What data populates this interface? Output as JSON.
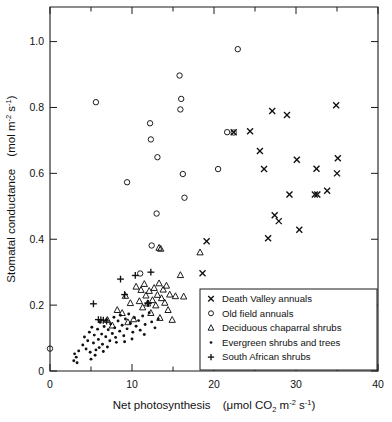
{
  "chart_data": {
    "type": "scatter",
    "title": "",
    "xlabel": "Net photosynthesis  (µmol CO2 m-2 s-1)",
    "ylabel": "Stomatal conductance  (mol m-2 s-1)",
    "xlim": [
      0,
      40
    ],
    "ylim": [
      0,
      1.105
    ],
    "grid": false,
    "legend_position": "bottom-right",
    "x_ticks_major": [
      0,
      10,
      20,
      30,
      40
    ],
    "x_ticks_minor": [
      5,
      15,
      25,
      35
    ],
    "x_tick_labels": [
      "0",
      "10",
      "20",
      "30",
      "40"
    ],
    "y_ticks_major": [
      0,
      0.2,
      0.4,
      0.6,
      0.8,
      1.0
    ],
    "y_tick_labels": [
      "0",
      "0.2",
      "0.4",
      "0.6",
      "0.8",
      "1.0"
    ],
    "series": [
      {
        "name": "Death Valley annuals",
        "marker": "x",
        "points": [
          [
            18.6,
            0.297
          ],
          [
            19.1,
            0.394
          ],
          [
            22.4,
            0.725
          ],
          [
            24.4,
            0.728
          ],
          [
            25.6,
            0.668
          ],
          [
            26.1,
            0.613
          ],
          [
            26.6,
            0.403
          ],
          [
            27.1,
            0.789
          ],
          [
            27.4,
            0.473
          ],
          [
            27.9,
            0.455
          ],
          [
            28.9,
            0.777
          ],
          [
            29.2,
            0.536
          ],
          [
            30.1,
            0.641
          ],
          [
            30.4,
            0.429
          ],
          [
            32.3,
            0.536
          ],
          [
            32.6,
            0.536
          ],
          [
            32.5,
            0.614
          ],
          [
            33.8,
            0.547
          ],
          [
            34.9,
            0.807
          ],
          [
            35.1,
            0.646
          ],
          [
            35.0,
            0.6
          ]
        ]
      },
      {
        "name": "Old field annuals",
        "marker": "o",
        "points": [
          [
            0.0,
            0.068
          ],
          [
            5.6,
            0.816
          ],
          [
            9.4,
            0.573
          ],
          [
            11.0,
            0.296
          ],
          [
            12.2,
            0.752
          ],
          [
            12.3,
            0.703
          ],
          [
            12.4,
            0.381
          ],
          [
            13.1,
            0.649
          ],
          [
            13.0,
            0.478
          ],
          [
            15.8,
            0.897
          ],
          [
            16.0,
            0.826
          ],
          [
            15.9,
            0.794
          ],
          [
            16.2,
            0.598
          ],
          [
            16.4,
            0.526
          ],
          [
            20.5,
            0.613
          ],
          [
            21.6,
            0.725
          ],
          [
            22.4,
            0.724
          ],
          [
            22.9,
            0.977
          ]
        ]
      },
      {
        "name": "Deciduous chaparral shrubs",
        "marker": "triangle",
        "points": [
          [
            7.0,
            0.155
          ],
          [
            7.6,
            0.138
          ],
          [
            8.2,
            0.185
          ],
          [
            8.8,
            0.176
          ],
          [
            9.2,
            0.228
          ],
          [
            9.5,
            0.148
          ],
          [
            9.8,
            0.206
          ],
          [
            10.2,
            0.157
          ],
          [
            10.5,
            0.256
          ],
          [
            10.9,
            0.212
          ],
          [
            11.1,
            0.246
          ],
          [
            11.3,
            0.193
          ],
          [
            11.5,
            0.264
          ],
          [
            11.7,
            0.229
          ],
          [
            11.9,
            0.205
          ],
          [
            12.1,
            0.243
          ],
          [
            12.3,
            0.176
          ],
          [
            12.5,
            0.215
          ],
          [
            12.7,
            0.252
          ],
          [
            12.9,
            0.199
          ],
          [
            13.1,
            0.231
          ],
          [
            13.3,
            0.266
          ],
          [
            13.4,
            0.161
          ],
          [
            13.6,
            0.221
          ],
          [
            13.8,
            0.247
          ],
          [
            14.0,
            0.207
          ],
          [
            14.2,
            0.259
          ],
          [
            14.4,
            0.185
          ],
          [
            14.6,
            0.232
          ],
          [
            14.9,
            0.155
          ],
          [
            15.3,
            0.227
          ],
          [
            15.9,
            0.291
          ],
          [
            16.3,
            0.226
          ],
          [
            13.3,
            0.374
          ],
          [
            13.5,
            0.371
          ],
          [
            18.3,
            0.36
          ]
        ]
      },
      {
        "name": "Evergreen shrubs and trees",
        "marker": "dot",
        "points": [
          [
            2.9,
            0.031
          ],
          [
            3.0,
            0.052
          ],
          [
            3.2,
            0.042
          ],
          [
            3.3,
            0.025
          ],
          [
            3.5,
            0.061
          ],
          [
            4.0,
            0.079
          ],
          [
            4.2,
            0.103
          ],
          [
            4.4,
            0.067
          ],
          [
            4.6,
            0.092
          ],
          [
            4.8,
            0.118
          ],
          [
            4.9,
            0.057
          ],
          [
            5.1,
            0.133
          ],
          [
            5.3,
            0.085
          ],
          [
            5.4,
            0.109
          ],
          [
            5.6,
            0.064
          ],
          [
            5.8,
            0.127
          ],
          [
            5.9,
            0.096
          ],
          [
            6.1,
            0.148
          ],
          [
            6.3,
            0.112
          ],
          [
            6.4,
            0.081
          ],
          [
            6.6,
            0.135
          ],
          [
            6.8,
            0.104
          ],
          [
            6.9,
            0.156
          ],
          [
            7.1,
            0.125
          ],
          [
            7.3,
            0.092
          ],
          [
            7.4,
            0.143
          ],
          [
            7.6,
            0.114
          ],
          [
            7.8,
            0.163
          ],
          [
            7.9,
            0.131
          ],
          [
            8.1,
            0.087
          ],
          [
            8.3,
            0.152
          ],
          [
            8.5,
            0.121
          ],
          [
            8.6,
            0.169
          ],
          [
            8.8,
            0.139
          ],
          [
            9.0,
            0.107
          ],
          [
            9.2,
            0.158
          ],
          [
            9.4,
            0.128
          ],
          [
            9.6,
            0.173
          ],
          [
            9.8,
            0.145
          ],
          [
            10.1,
            0.118
          ],
          [
            10.3,
            0.162
          ],
          [
            10.5,
            0.136
          ],
          [
            10.8,
            0.153
          ],
          [
            11.0,
            0.124
          ],
          [
            11.3,
            0.167
          ],
          [
            11.6,
            0.141
          ],
          [
            11.9,
            0.205
          ],
          [
            12.1,
            0.177
          ],
          [
            12.4,
            0.149
          ],
          [
            12.8,
            0.131
          ],
          [
            13.2,
            0.158
          ],
          [
            5.0,
            0.036
          ],
          [
            5.5,
            0.048
          ],
          [
            6.0,
            0.071
          ],
          [
            6.5,
            0.059
          ],
          [
            7.0,
            0.073
          ],
          [
            8.0,
            0.102
          ],
          [
            9.1,
            0.089
          ],
          [
            10.0,
            0.097
          ],
          [
            11.5,
            0.111
          ]
        ]
      },
      {
        "name": "South African shrubs",
        "marker": "plus",
        "points": [
          [
            5.3,
            0.204
          ],
          [
            5.9,
            0.156
          ],
          [
            6.2,
            0.155
          ],
          [
            6.5,
            0.154
          ],
          [
            6.9,
            0.152
          ],
          [
            8.6,
            0.279
          ],
          [
            9.1,
            0.232
          ],
          [
            10.4,
            0.29
          ],
          [
            11.9,
            0.206
          ],
          [
            12.0,
            0.205
          ],
          [
            12.3,
            0.3
          ]
        ]
      }
    ]
  },
  "legend": {
    "entries": [
      {
        "label": "Death Valley annuals",
        "marker": "x"
      },
      {
        "label": "Old field annuals",
        "marker": "o"
      },
      {
        "label": "Deciduous chaparral shrubs",
        "marker": "triangle"
      },
      {
        "label": "Evergreen shrubs and trees",
        "marker": "dot"
      },
      {
        "label": "South African shrubs",
        "marker": "plus"
      }
    ]
  },
  "axis_titles": {
    "x_main": "Net photosynthesis",
    "x_unit_open": "(",
    "x_unit_mu": "μ",
    "x_unit_mol": "mol CO",
    "x_unit_co2_sub": "2",
    "x_unit_m": " m",
    "x_unit_m_sup": "-2",
    "x_unit_s": " s",
    "x_unit_s_sup": "-1",
    "x_unit_close": ")",
    "y_main": "Stomatal conductance",
    "y_unit_open": "(",
    "y_unit_mol": "mol m",
    "y_unit_m_sup": "-2",
    "y_unit_s": " s",
    "y_unit_s_sup": "-1",
    "y_unit_close": ")"
  },
  "colors": {
    "axis": "#1a1a1a",
    "marker": "#111111",
    "background": "#ffffff"
  }
}
